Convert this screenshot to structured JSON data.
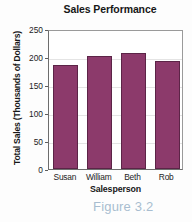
{
  "chart_data": {
    "type": "bar",
    "title": "Sales Performance",
    "xlabel": "Salesperson",
    "ylabel": "Total Sales (Thousands of Dollars)",
    "categories": [
      "Susan",
      "William",
      "Beth",
      "Rob"
    ],
    "values": [
      186,
      201,
      207,
      193
    ],
    "ylim": [
      0,
      250
    ],
    "yticks": [
      0,
      50,
      100,
      150,
      200,
      250
    ],
    "ytick_labels": [
      "0",
      "50",
      "100",
      "150",
      "200",
      "250"
    ],
    "grid": true,
    "legend": null,
    "series": [
      {
        "name": "Total Sales",
        "values": [
          186,
          201,
          207,
          193
        ],
        "color": "#8C3A6B"
      }
    ]
  },
  "caption": {
    "text": "Figure 3.2",
    "color": "#A8BDD0"
  },
  "colors": {
    "bar_fill": "#8C3A6B",
    "bar_border": "#5C2447",
    "axis": "#5D5D5D",
    "grid": "#E4E4E4",
    "text": "#1C1C1C",
    "background": "#FDFDFD"
  }
}
